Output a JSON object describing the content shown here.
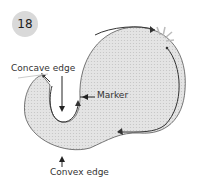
{
  "step": {
    "number": "18"
  },
  "labels": {
    "concave": "Concave edge",
    "marker": "Marker",
    "convex": "Convex edge"
  },
  "colors": {
    "fabric": "#dcdcdc",
    "outline": "#444444",
    "badge": "#d9d9d9"
  }
}
